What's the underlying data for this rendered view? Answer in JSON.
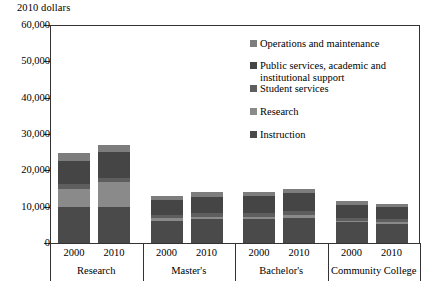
{
  "chart_data": {
    "type": "bar",
    "subtype": "stacked-bar-grouped",
    "title": "",
    "ylabel": "2010 dollars",
    "xlabel": "",
    "ylim": [
      0,
      60000
    ],
    "ytick_values": [
      0,
      10000,
      20000,
      30000,
      40000,
      50000,
      60000
    ],
    "ytick_labels": [
      "0",
      "10,000",
      "20,000",
      "30,000",
      "40,000",
      "50,000",
      "60,000"
    ],
    "grid": false,
    "legend_position": "upper right inside",
    "categories": [
      "2000",
      "2010",
      "2000",
      "2010",
      "2000",
      "2010",
      "2000",
      "2010"
    ],
    "groups": [
      {
        "label": "Research",
        "years": [
          "2000",
          "2010"
        ]
      },
      {
        "label": "Master's",
        "years": [
          "2000",
          "2010"
        ]
      },
      {
        "label": "Bachelor's",
        "years": [
          "2000",
          "2010"
        ]
      },
      {
        "label": "Community College",
        "years": [
          "2000",
          "2010"
        ]
      }
    ],
    "series": [
      {
        "name": "Instruction",
        "color": "#4a4a4a",
        "values": [
          10000,
          10000,
          6100,
          6500,
          6600,
          7000,
          5700,
          5300
        ]
      },
      {
        "name": "Research",
        "color": "#8a8a8a",
        "values": [
          5000,
          6800,
          700,
          700,
          700,
          700,
          400,
          400
        ]
      },
      {
        "name": "Student services",
        "color": "#5e5e5e",
        "values": [
          1200,
          1200,
          900,
          1000,
          1100,
          1200,
          900,
          900
        ]
      },
      {
        "name": "Public services, academic and institutional support",
        "color": "#454545",
        "values": [
          6500,
          7000,
          4200,
          4600,
          4500,
          4900,
          3600,
          3400
        ]
      },
      {
        "name": "Operations and maintenance",
        "color": "#7d7d7d",
        "values": [
          2100,
          2000,
          1100,
          1200,
          1100,
          1200,
          900,
          800
        ]
      }
    ],
    "totals": [
      24800,
      27000,
      13000,
      14000,
      14000,
      15000,
      11500,
      10800
    ]
  },
  "legend": {
    "items": [
      {
        "label": "Operations and maintenance",
        "color": "#7d7d7d"
      },
      {
        "label": "Public services, academic and institutional support",
        "color": "#454545"
      },
      {
        "label": "Student services",
        "color": "#5e5e5e"
      },
      {
        "label": "Research",
        "color": "#8a8a8a"
      },
      {
        "label": "Instruction",
        "color": "#4a4a4a"
      }
    ]
  },
  "axis": {
    "title": "2010 dollars"
  }
}
